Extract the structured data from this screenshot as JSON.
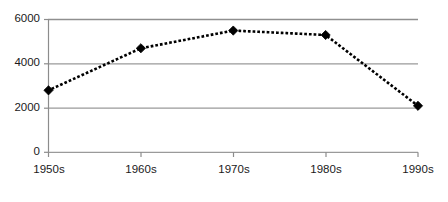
{
  "chart_data": {
    "type": "line",
    "title": "",
    "subtitle": "",
    "xlabel": "",
    "ylabel": "",
    "categories": [
      "1950s",
      "1960s",
      "1970s",
      "1980s",
      "1990s"
    ],
    "values": [
      2800,
      4700,
      5500,
      5300,
      2100
    ],
    "series": [
      {
        "name": "",
        "values": [
          2800,
          4700,
          5500,
          5300,
          2100
        ]
      }
    ],
    "ylim": [
      0,
      6000
    ],
    "y_ticks": [
      0,
      2000,
      4000,
      6000
    ],
    "y_tick_labels": [
      "0",
      "2000",
      "4000",
      "6000"
    ],
    "x_tick_labels": [
      "1950s",
      "1960s",
      "1970s",
      "1980s",
      "1990s"
    ],
    "grid": true,
    "grid_axis": "y",
    "legend": false,
    "legend_position": "none",
    "line_style": "dotted",
    "marker": "diamond",
    "annotations": []
  },
  "style": {
    "background_color": "#ffffff",
    "line_color": "#000000",
    "marker_color": "#000000",
    "grid_color": "#9a9a9a",
    "axis_color": "#8c8c8c",
    "tick_label_color": "#1a1a1a"
  }
}
